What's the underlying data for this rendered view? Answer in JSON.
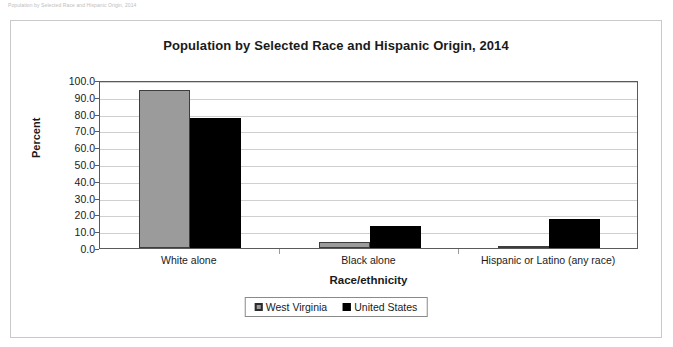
{
  "caption_strip": "Population by Selected Race and Hispanic Origin, 2014",
  "chart_data": {
    "type": "bar",
    "title": "Population by Selected Race and Hispanic Origin, 2014",
    "xlabel": "Race/ethnicity",
    "ylabel": "Percent",
    "ylim": [
      0,
      100
    ],
    "ytick_labels": [
      "100.0",
      "90.0",
      "80.0",
      "70.0",
      "60.0",
      "50.0",
      "40.0",
      "30.0",
      "20.0",
      "10.0",
      "0.0"
    ],
    "yticks": [
      100,
      90,
      80,
      70,
      60,
      50,
      40,
      30,
      20,
      10,
      0
    ],
    "grid": true,
    "legend_position": "bottom-center",
    "categories": [
      "White alone",
      "Black alone",
      "Hispanic or Latino (any race)"
    ],
    "series": [
      {
        "name": "West Virginia",
        "color": "#9b9b9b",
        "values": [
          94.0,
          3.5,
          1.4
        ]
      },
      {
        "name": "United States",
        "color": "#000000",
        "values": [
          77.4,
          13.2,
          17.4
        ]
      }
    ]
  }
}
